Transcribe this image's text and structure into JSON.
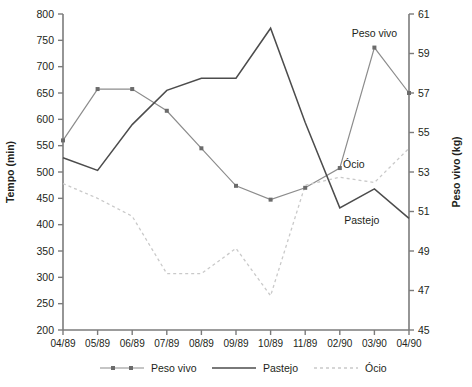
{
  "chart_data": {
    "type": "line",
    "title": "",
    "categories": [
      "04/89",
      "05/89",
      "06/89",
      "07/89",
      "08/89",
      "09/89",
      "10/89",
      "11/89",
      "02/90",
      "03/90",
      "04/90"
    ],
    "xlabel": "",
    "ylabel": "Tempo (min)",
    "ylim": [
      200,
      800
    ],
    "y_ticks": [
      200,
      250,
      300,
      350,
      400,
      450,
      500,
      550,
      600,
      650,
      700,
      750,
      800
    ],
    "y2label": "Peso vivo (kg)",
    "y2lim": [
      45,
      61
    ],
    "y2_ticks": [
      45,
      47,
      49,
      51,
      53,
      55,
      57,
      59,
      61
    ],
    "grid": false,
    "legend_position": "bottom",
    "series": [
      {
        "name": "Peso vivo",
        "axis": "right",
        "style": "line-markers",
        "color": "#8c8c8c",
        "values": [
          54.6,
          57.2,
          57.2,
          56.1,
          54.2,
          52.3,
          51.6,
          52.2,
          53.2,
          59.3,
          57.0
        ]
      },
      {
        "name": "Pastejo",
        "axis": "left",
        "style": "solid",
        "color": "#4c4c4c",
        "values": [
          527,
          503,
          590,
          655,
          678,
          678,
          773,
          594,
          432,
          468,
          412
        ]
      },
      {
        "name": "Ócio",
        "axis": "left",
        "style": "dotted",
        "color": "#c9c9c9",
        "values": [
          478,
          450,
          416,
          307,
          307,
          355,
          265,
          475,
          490,
          480,
          545
        ]
      }
    ],
    "annotations": [
      {
        "text": "Peso vivo",
        "series": "Peso vivo",
        "at": "03/90"
      },
      {
        "text": "Ócio",
        "series": "Ócio",
        "at": "02/90"
      },
      {
        "text": "Pastejo",
        "series": "Pastejo",
        "at": "02/90"
      }
    ]
  },
  "legend": {
    "items": [
      {
        "label": "Peso vivo",
        "marker": "line-with-square-markers"
      },
      {
        "label": "Pastejo",
        "marker": "solid-line"
      },
      {
        "label": "Ócio",
        "marker": "dotted-line"
      }
    ]
  },
  "axes": {
    "left_title": "Tempo (min)",
    "right_title": "Peso vivo (kg)"
  }
}
